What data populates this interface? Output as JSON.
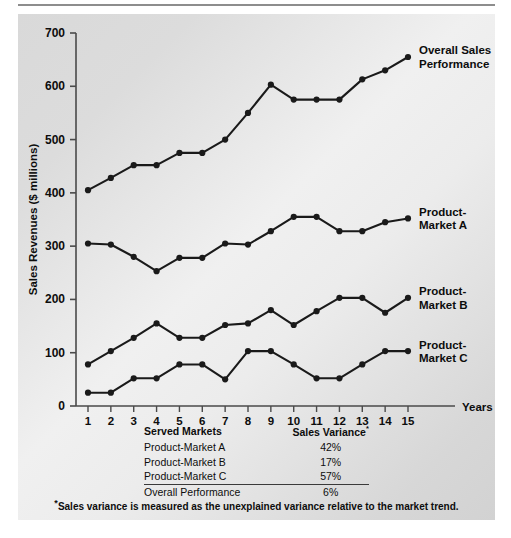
{
  "chart_data": {
    "type": "line",
    "title": "",
    "xlabel": "Years",
    "ylabel": "Sales Revenues ($ millions)",
    "x": [
      1,
      2,
      3,
      4,
      5,
      6,
      7,
      8,
      9,
      10,
      11,
      12,
      13,
      14,
      15
    ],
    "xtick_labels": [
      "1",
      "2",
      "3",
      "4",
      "5",
      "6",
      "7",
      "8",
      "9",
      "10",
      "11",
      "12",
      "13",
      "14",
      "15"
    ],
    "ytick_labels": [
      "0",
      "100",
      "200",
      "300",
      "400",
      "500",
      "600",
      "700"
    ],
    "yticks": [
      0,
      100,
      200,
      300,
      400,
      500,
      600,
      700
    ],
    "ylim": [
      0,
      700
    ],
    "xlim": [
      1,
      15
    ],
    "grid": false,
    "legend_position": "right-inline-end-of-line",
    "series": [
      {
        "name": "Overall Sales Performance",
        "label_lines": [
          "Overall Sales",
          "Performance"
        ],
        "values": [
          405,
          428,
          452,
          452,
          475,
          475,
          500,
          550,
          603,
          575,
          575,
          575,
          613,
          630,
          655
        ]
      },
      {
        "name": "Product-Market A",
        "label_lines": [
          "Product-",
          "Market A"
        ],
        "values": [
          305,
          303,
          280,
          253,
          278,
          278,
          305,
          303,
          328,
          355,
          355,
          328,
          328,
          345,
          352
        ]
      },
      {
        "name": "Product-Market B",
        "label_lines": [
          "Product-",
          "Market B"
        ],
        "values": [
          78,
          103,
          128,
          155,
          128,
          128,
          152,
          155,
          180,
          152,
          178,
          203,
          203,
          175,
          203
        ]
      },
      {
        "name": "Product-Market C",
        "label_lines": [
          "Product-",
          "Market C"
        ],
        "values": [
          25,
          25,
          52,
          52,
          78,
          78,
          50,
          103,
          103,
          78,
          52,
          52,
          78,
          103,
          103
        ]
      }
    ],
    "colors": {
      "line": "#1a1a1a",
      "marker": "#1a1a1a",
      "axis": "#4a4a4a",
      "panel_background": "#e0e0e0",
      "text": "#0d0d0d"
    }
  },
  "table": {
    "headers": {
      "markets": "Served Markets",
      "variance": "Sales Variance",
      "variance_marker": "*"
    },
    "rows": [
      {
        "market": "Product-Market A",
        "variance": "42%"
      },
      {
        "market": "Product-Market B",
        "variance": "17%"
      },
      {
        "market": "Product-Market C",
        "variance": "57%"
      },
      {
        "market": "Overall Performance",
        "variance": "6%"
      }
    ]
  },
  "footnote": {
    "marker": "*",
    "text": "Sales variance is measured as the unexplained variance relative to the market trend."
  }
}
